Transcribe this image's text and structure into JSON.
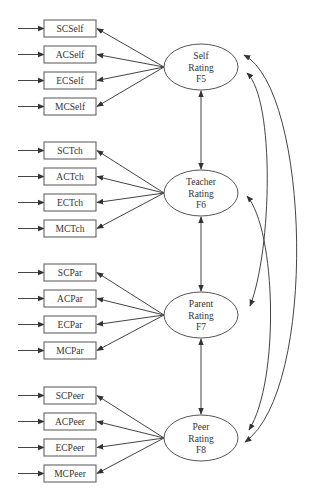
{
  "diagram": {
    "type": "structural-equation-model",
    "colors": {
      "stroke": "#555555",
      "text": "#333333",
      "background": "#ffffff"
    },
    "factors": [
      {
        "id": "F5",
        "lines": [
          "Self",
          "Rating",
          "F5"
        ],
        "cx": 201,
        "cy": 67,
        "indicators": [
          {
            "label": "SCSelf",
            "y": 20
          },
          {
            "label": "ACSelf",
            "y": 46
          },
          {
            "label": "ECSelf",
            "y": 72
          },
          {
            "label": "MCSelf",
            "y": 98
          }
        ]
      },
      {
        "id": "F6",
        "lines": [
          "Teacher",
          "Rating",
          "F6"
        ],
        "cx": 201,
        "cy": 193,
        "indicators": [
          {
            "label": "SCTch",
            "y": 142
          },
          {
            "label": "ACTch",
            "y": 168
          },
          {
            "label": "ECTch",
            "y": 194
          },
          {
            "label": "MCTch",
            "y": 220
          }
        ]
      },
      {
        "id": "F7",
        "lines": [
          "Parent",
          "Rating",
          "F7"
        ],
        "cx": 201,
        "cy": 315,
        "indicators": [
          {
            "label": "SCPar",
            "y": 264
          },
          {
            "label": "ACPar",
            "y": 290
          },
          {
            "label": "ECPar",
            "y": 316
          },
          {
            "label": "MCPar",
            "y": 342
          }
        ]
      },
      {
        "id": "F8",
        "lines": [
          "Peer",
          "Rating",
          "F8"
        ],
        "cx": 201,
        "cy": 438,
        "indicators": [
          {
            "label": "SCPeer",
            "y": 387
          },
          {
            "label": "ACPeer",
            "y": 413
          },
          {
            "label": "ECPeer",
            "y": 439
          },
          {
            "label": "MCPeer",
            "y": 465
          }
        ]
      }
    ],
    "correlations": [
      [
        "F5",
        "F6"
      ],
      [
        "F6",
        "F7"
      ],
      [
        "F7",
        "F8"
      ],
      [
        "F5",
        "F7"
      ],
      [
        "F6",
        "F8"
      ],
      [
        "F5",
        "F8"
      ]
    ]
  }
}
